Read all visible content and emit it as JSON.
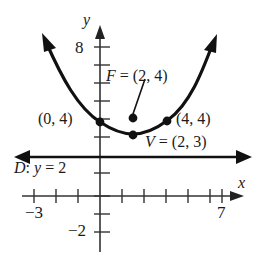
{
  "figure": {
    "kind": "parabola-graph",
    "axes": {
      "x_axis_name": "x",
      "y_axis_name": "y",
      "x_tick_labels": [
        "-3",
        "7"
      ],
      "y_tick_labels": [
        "8",
        "-2"
      ],
      "x_label_left": "−3",
      "x_label_right": "7",
      "y_label_top": "8",
      "y_label_bottom": "−2",
      "x_range": [
        -4,
        8
      ],
      "y_range": [
        -3,
        9
      ],
      "x_ticks": [
        -3,
        -2,
        -1,
        1,
        2,
        3,
        4,
        5,
        6,
        7
      ],
      "y_ticks": [
        -2,
        -1,
        1,
        2,
        3,
        4,
        5,
        6,
        7,
        8
      ],
      "grid": false
    },
    "labels": {
      "focus": "F = (2, 4)",
      "focus_letter": "F",
      "focus_rest": " = (2, 4)",
      "vertex": "V = (2, 3)",
      "vertex_letter": "V",
      "vertex_rest": " = (2, 3)",
      "left_point": "(0, 4)",
      "right_point": "(4, 4)",
      "directrix": "D: y = 2",
      "directrix_letter": "D",
      "directrix_mid": ": ",
      "directrix_var": "y",
      "directrix_rest": " = 2"
    },
    "points": [
      {
        "name": "left-point",
        "label": "(0, 4)",
        "x": 0,
        "y": 4
      },
      {
        "name": "focus-point",
        "label": "F = (2, 4)",
        "x": 2,
        "y": 4
      },
      {
        "name": "vertex-point",
        "label": "V = (2, 3)",
        "x": 2,
        "y": 3
      },
      {
        "name": "right-point",
        "label": "(4, 4)",
        "x": 4,
        "y": 4
      }
    ],
    "curve": {
      "type": "parabola",
      "vertex": [
        2,
        3
      ],
      "focus": [
        2,
        4
      ],
      "directrix_y": 2,
      "equation": "y = (1/4)(x - 2)^2 + 3"
    },
    "colors": {
      "ink": "#111111",
      "background": "#ffffff",
      "axis": "#3a3a3a"
    }
  }
}
